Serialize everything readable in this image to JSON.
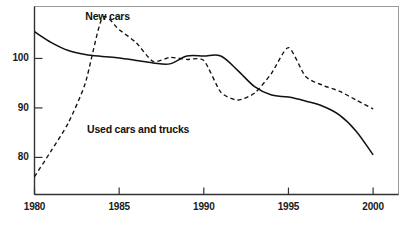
{
  "chart_data": {
    "type": "line",
    "title": "",
    "xlabel": "",
    "ylabel": "",
    "xlim": [
      1980,
      2001.5
    ],
    "ylim": [
      72.5,
      110.5
    ],
    "xticks": [
      1980,
      1985,
      1990,
      1995,
      2000
    ],
    "xtick_labels": [
      "1980",
      "1985",
      "1990",
      "1995",
      "2000"
    ],
    "yticks": [
      80,
      90,
      100
    ],
    "ytick_labels": [
      "80",
      "90",
      "100"
    ],
    "grid": false,
    "legend_position": "inline-annotations",
    "x": [
      1980,
      1981,
      1982,
      1983,
      1984,
      1985,
      1986,
      1987,
      1988,
      1989,
      1990,
      1991,
      1992,
      1993,
      1994,
      1995,
      1996,
      1997,
      1998,
      1999,
      2000
    ],
    "series": [
      {
        "name": "New cars",
        "style": "solid",
        "color": "#111111",
        "values": [
          105.4,
          103.2,
          101.6,
          100.8,
          100.4,
          100.1,
          99.6,
          99.1,
          98.9,
          100.5,
          100.5,
          100.5,
          97.6,
          94.3,
          92.6,
          92.2,
          91.4,
          90.4,
          88.6,
          85.3,
          80.5
        ]
      },
      {
        "name": "Used cars and trucks",
        "style": "dashed",
        "color": "#111111",
        "values": [
          76.1,
          81.4,
          87.0,
          95.0,
          108.2,
          105.8,
          103.2,
          99.4,
          100.2,
          99.8,
          99.6,
          93.2,
          91.6,
          93.0,
          97.0,
          102.2,
          96.4,
          94.6,
          93.4,
          91.6,
          89.8
        ]
      }
    ],
    "annotations": [
      {
        "text": "New cars",
        "x": 1983.0,
        "y": 108.4
      },
      {
        "text": "Used cars and trucks",
        "x": 1983.1,
        "y": 85.6
      }
    ]
  },
  "axes": {
    "frame_color": "#8c8c8c",
    "axis_color": "#3a3a3a"
  }
}
